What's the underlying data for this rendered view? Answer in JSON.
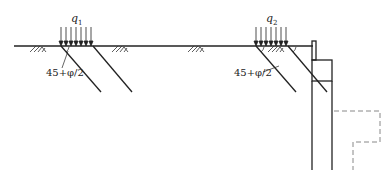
{
  "diagram": {
    "title": "",
    "loads": [
      {
        "id": "q1",
        "symbol": "q",
        "subscript": "1"
      },
      {
        "id": "q2",
        "symbol": "q",
        "subscript": "2"
      }
    ],
    "angle_labels": [
      {
        "id": "angle-1",
        "text": "45+φ/2"
      },
      {
        "id": "angle-2",
        "text": "45+φ/2"
      }
    ],
    "elements": [
      "ground-surface",
      "soil-hatch",
      "surcharge-arrows",
      "failure-planes",
      "retaining-wall",
      "dashed-excavation-outline"
    ],
    "colors": {
      "line": "#222222",
      "dashed": "#888888",
      "background": "#ffffff"
    }
  }
}
